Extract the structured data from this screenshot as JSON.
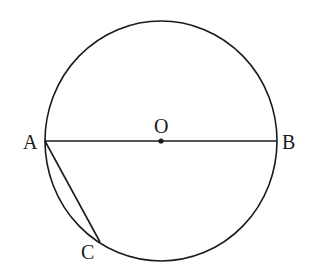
{
  "diagram": {
    "type": "geometry",
    "colors": {
      "stroke": "#1a1a1a",
      "background": "#ffffff"
    },
    "circle": {
      "center_label": "O",
      "cx": 161,
      "cy": 141,
      "rx": 116,
      "ry": 120
    },
    "points": [
      {
        "label": "A",
        "x": 45,
        "y": 141
      },
      {
        "label": "B",
        "x": 277,
        "y": 141
      },
      {
        "label": "O",
        "x": 161,
        "y": 141
      },
      {
        "label": "C",
        "x": 100,
        "y": 242
      }
    ],
    "segments": [
      {
        "name": "diameter-AB",
        "from": "A",
        "to": "B"
      },
      {
        "name": "chord-AC",
        "from": "A",
        "to": "C"
      }
    ],
    "labels": {
      "A": "A",
      "B": "B",
      "O": "O",
      "C": "C"
    }
  }
}
